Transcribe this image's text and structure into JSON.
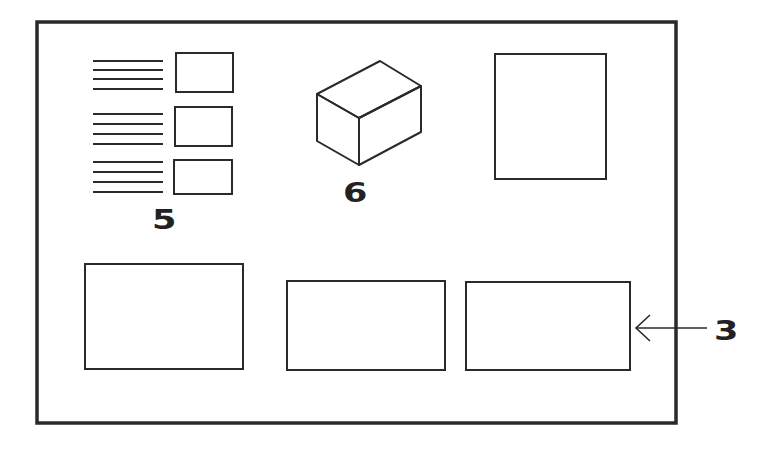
{
  "diagram": {
    "colors": {
      "stroke": "#2a2a2a",
      "frame": "#2a2a2a",
      "background": "#ffffff",
      "label": "#222222"
    },
    "frame": {
      "x": 37,
      "y": 22,
      "w": 639,
      "h": 401
    },
    "labels": [
      {
        "id": "5",
        "text": "5",
        "x": 152,
        "y": 207
      },
      {
        "id": "6",
        "text": "6",
        "x": 343,
        "y": 180
      },
      {
        "id": "3",
        "text": "3",
        "x": 714,
        "y": 318
      }
    ],
    "group_5": {
      "label": "5",
      "rows": [
        {
          "lines_y": [
            61,
            70,
            79,
            89
          ],
          "box": {
            "x": 176,
            "y": 53,
            "w": 57,
            "h": 39
          }
        },
        {
          "lines_y": [
            114,
            124,
            134,
            144
          ],
          "box": {
            "x": 175,
            "y": 107,
            "w": 57,
            "h": 39
          }
        },
        {
          "lines_y": [
            162,
            172,
            182,
            192
          ],
          "box": {
            "x": 174,
            "y": 160,
            "w": 58,
            "h": 34
          }
        }
      ],
      "lines_x1": 93,
      "lines_x2": 163
    },
    "cube": {
      "label": "6",
      "points": {
        "top": [
          380,
          61
        ],
        "left_top": [
          317,
          94
        ],
        "front_top": [
          359,
          118
        ],
        "right_top": [
          421,
          86
        ],
        "left_bottom": [
          317,
          141
        ],
        "front_bottom": [
          359,
          165
        ],
        "right_bottom": [
          421,
          132
        ]
      }
    },
    "tall_box": {
      "x": 495,
      "y": 54,
      "w": 111,
      "h": 125
    },
    "bottom_boxes": [
      {
        "id": "box-left",
        "x": 85,
        "y": 264,
        "w": 158,
        "h": 105
      },
      {
        "id": "box-middle",
        "x": 287,
        "y": 281,
        "w": 158,
        "h": 89
      },
      {
        "id": "box-right",
        "x": 466,
        "y": 282,
        "w": 164,
        "h": 88
      }
    ],
    "arrow_3": {
      "label": "3",
      "from": [
        707,
        328
      ],
      "to": [
        636,
        328
      ]
    }
  }
}
